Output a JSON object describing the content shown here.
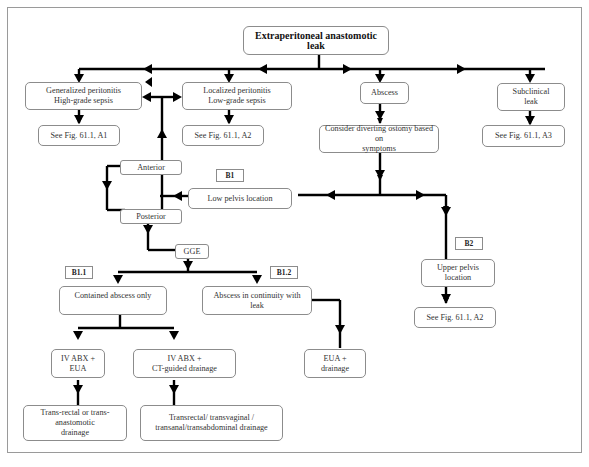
{
  "diagram": {
    "title": "Extraperitoneal anastomotic leak",
    "nodes": {
      "generalized": "Generalized peritonitis\nHigh-grade sepsis",
      "localized": "Localized peritonitis\nLow-grade sepsis",
      "abscess": "Abscess",
      "subclinical": "Subclinical\nleak",
      "see_a1": "See Fig. 61.1, A1",
      "see_a2_top": "See Fig. 61.1, A2",
      "see_a3": "See Fig. 61.1, A3",
      "diverting": "Consider diverting ostomy based on\nsymptoms",
      "anterior": "Anterior",
      "posterior": "Posterior",
      "low_pelvis": "Low pelvis location",
      "gge": "GGE",
      "upper_pelvis": "Upper pelvis\nlocation",
      "see_a2_bottom": "See Fig. 61.1, A2",
      "contained": "Contained abscess only",
      "continuity": "Abscess in continuity with\nleak",
      "ivabx_eua": "IV ABX +\nEUA",
      "ivabx_ct": "IV ABX +\nCT-guided drainage",
      "eua_drainage": "EUA +\ndrainage",
      "transrectal_anast": "Trans-rectal or trans-\nanastomotic\ndrainage",
      "transrectal_multi": "Transrectal/ transvaginal /\ntransanal/transabdominal drainage"
    },
    "labels": {
      "b1": "B1",
      "b2": "B2",
      "b1_1": "B1.1",
      "b1_2": "B1.2"
    }
  }
}
